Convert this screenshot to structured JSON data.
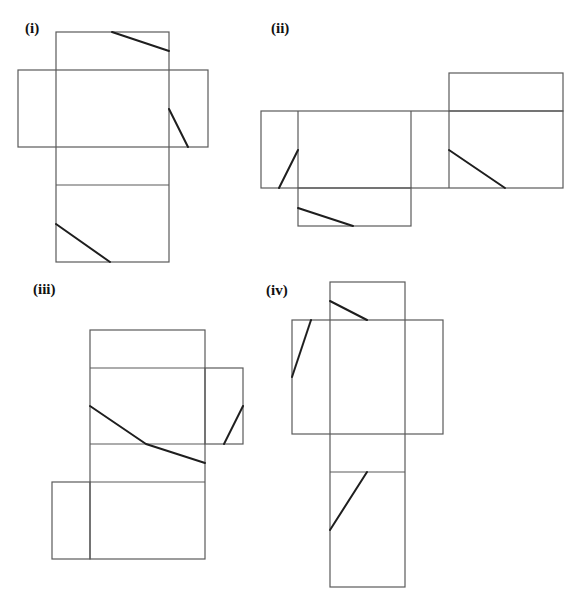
{
  "figure": {
    "nets": [
      {
        "id": "i",
        "label": "(i)"
      },
      {
        "id": "ii",
        "label": "(ii)"
      },
      {
        "id": "iii",
        "label": "(iii)"
      },
      {
        "id": "iv",
        "label": "(iv)"
      }
    ]
  }
}
